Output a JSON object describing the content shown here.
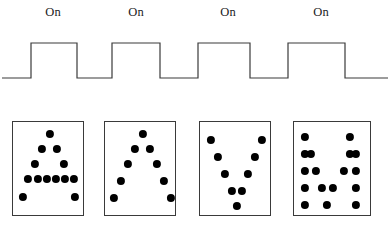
{
  "figure": {
    "title": "",
    "width": 391,
    "height": 233,
    "background_color": "#ffffff",
    "line_color": "#3a3a3a",
    "dot_color": "#000000"
  },
  "timing": {
    "label_text": "On",
    "labels": [
      {
        "text": "On",
        "x": 53,
        "y": 6
      },
      {
        "text": "On",
        "x": 136,
        "y": 6
      },
      {
        "text": "On",
        "x": 228,
        "y": 6
      },
      {
        "text": "On",
        "x": 321,
        "y": 6
      }
    ],
    "waveform": {
      "baseline_y": 78,
      "high_y": 43,
      "stroke_width": 1.2,
      "stroke_color": "#3a3a3a",
      "points": "2,78 31,78 31,43 77,43 77,78 112,78 112,43 160,43 160,78 198,78 198,43 250,43 250,78 288,78 288,43 345,43 345,78 388,78"
    }
  },
  "panels": [
    {
      "name": "panel-1",
      "shape_label": "triangle",
      "box": {
        "x": 12,
        "y": 121,
        "width": 72,
        "height": 95
      },
      "dot_radius": 4.1,
      "dots": [
        [
          37,
          133
        ],
        [
          29,
          148
        ],
        [
          44,
          148
        ],
        [
          22,
          163
        ],
        [
          51,
          163
        ],
        [
          15,
          178
        ],
        [
          25,
          178
        ],
        [
          34,
          178
        ],
        [
          43,
          178
        ],
        [
          52,
          178
        ],
        [
          61,
          178
        ],
        [
          10,
          196
        ],
        [
          62,
          196
        ]
      ]
    },
    {
      "name": "panel-2",
      "shape_label": "lambda",
      "box": {
        "x": 104,
        "y": 121,
        "width": 72,
        "height": 95
      },
      "dot_radius": 4.1,
      "dots": [
        [
          38,
          133
        ],
        [
          30,
          148
        ],
        [
          45,
          148
        ],
        [
          23,
          163
        ],
        [
          52,
          163
        ],
        [
          16,
          180
        ],
        [
          59,
          180
        ],
        [
          9,
          197
        ],
        [
          66,
          197
        ]
      ]
    },
    {
      "name": "panel-3",
      "shape_label": "vee",
      "box": {
        "x": 199,
        "y": 121,
        "width": 72,
        "height": 95
      },
      "dot_radius": 4.1,
      "dots": [
        [
          11,
          139
        ],
        [
          62,
          139
        ],
        [
          18,
          156
        ],
        [
          55,
          156
        ],
        [
          25,
          173
        ],
        [
          48,
          173
        ],
        [
          32,
          190
        ],
        [
          42,
          190
        ],
        [
          37,
          205
        ]
      ]
    },
    {
      "name": "panel-4",
      "shape_label": "double-vee",
      "box": {
        "x": 293,
        "y": 121,
        "width": 78,
        "height": 95
      },
      "dot_radius": 4.1,
      "dots": [
        [
          11,
          136
        ],
        [
          56,
          136
        ],
        [
          11,
          153
        ],
        [
          17,
          153
        ],
        [
          56,
          153
        ],
        [
          62,
          153
        ],
        [
          11,
          170
        ],
        [
          22,
          170
        ],
        [
          50,
          170
        ],
        [
          62,
          170
        ],
        [
          11,
          187
        ],
        [
          28,
          187
        ],
        [
          39,
          187
        ],
        [
          62,
          187
        ],
        [
          11,
          204
        ],
        [
          33,
          204
        ],
        [
          62,
          204
        ]
      ]
    }
  ]
}
